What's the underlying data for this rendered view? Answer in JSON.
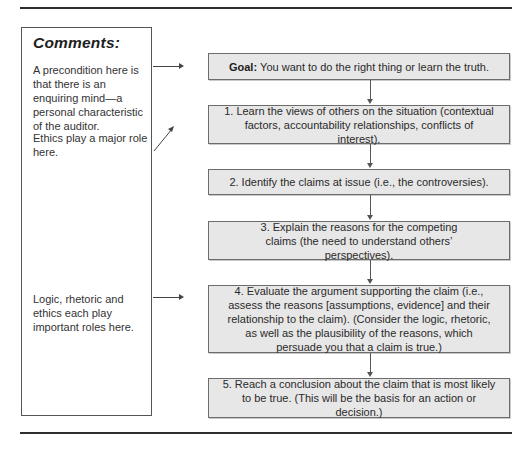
{
  "comments": {
    "title": "Comments:",
    "notes": [
      "A precondition here is that there is an enquiring mind—a personal characteristic of the auditor.",
      "Ethics play a major role here.",
      "Logic, rhetoric and ethics each play important roles here."
    ]
  },
  "flow": {
    "goal": {
      "label": "Goal:",
      "text": "You want to do the right thing or learn the truth."
    },
    "steps": [
      "1. Learn the views of others on the situation (contextual factors, accountability relationships, conflicts of interest).",
      "2. Identify the claims at issue (i.e., the controversies).",
      "3. Explain the reasons for the competing claims (the need to understand others’ perspectives).",
      "4. Evaluate the argument supporting the claim (i.e., assess the reasons [assumptions, evidence] and their relationship to the claim). (Consider the logic, rhetoric, as well as the plausibility of the reasons, which persuade you that a claim is true.)",
      "5. Reach a conclusion about the claim that is most likely to be true. (This will be the basis for an action or decision.)"
    ]
  },
  "colors": {
    "box_fill": "#e7e7e7",
    "box_border": "#6c6c6c",
    "rule": "#2e2e2e",
    "text": "#2a2a2a"
  }
}
